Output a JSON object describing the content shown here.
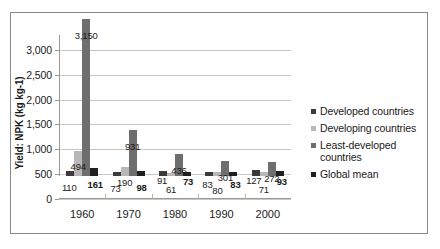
{
  "chart_data": {
    "type": "bar",
    "title": "",
    "xlabel": "",
    "ylabel": "Yield: NPK (kg kg-1)",
    "categories": [
      "1960",
      "1970",
      "1980",
      "1990",
      "2000"
    ],
    "yticks": [
      "0",
      "500",
      "1,000",
      "1,500",
      "2,000",
      "2,500",
      "3,000"
    ],
    "ytick_values": [
      0,
      500,
      1000,
      1500,
      2000,
      2500,
      3000
    ],
    "ylim": [
      0,
      3300
    ],
    "grid": true,
    "legend_position": "right",
    "series": [
      {
        "name": "Developed countries",
        "color": "#3b3b3b",
        "values": [
          110,
          73,
          91,
          83,
          127
        ],
        "labels": [
          "110",
          "73",
          "91",
          "83",
          "127"
        ]
      },
      {
        "name": "Developing countries",
        "color": "#b8b8b8",
        "values": [
          494,
          190,
          61,
          80,
          71
        ],
        "labels": [
          "494",
          "190",
          "61",
          "80",
          "71"
        ]
      },
      {
        "name": "Least-developed countries",
        "color": "#6e6e6e",
        "values": [
          3150,
          931,
          436,
          301,
          272
        ],
        "labels": [
          "3,150",
          "931",
          "436",
          "301",
          "272"
        ]
      },
      {
        "name": "Global mean",
        "color": "#1f1f1f",
        "values": [
          161,
          98,
          73,
          83,
          93
        ],
        "labels": [
          "161",
          "98",
          "73",
          "83",
          "93"
        ]
      }
    ]
  },
  "legend": {
    "items": [
      {
        "label": "Developed countries",
        "color": "#3b3b3b"
      },
      {
        "label": "Developing countries",
        "color": "#b8b8b8"
      },
      {
        "label": "Least-developed countries",
        "color": "#6e6e6e"
      },
      {
        "label": "Global mean",
        "color": "#1f1f1f"
      }
    ]
  }
}
